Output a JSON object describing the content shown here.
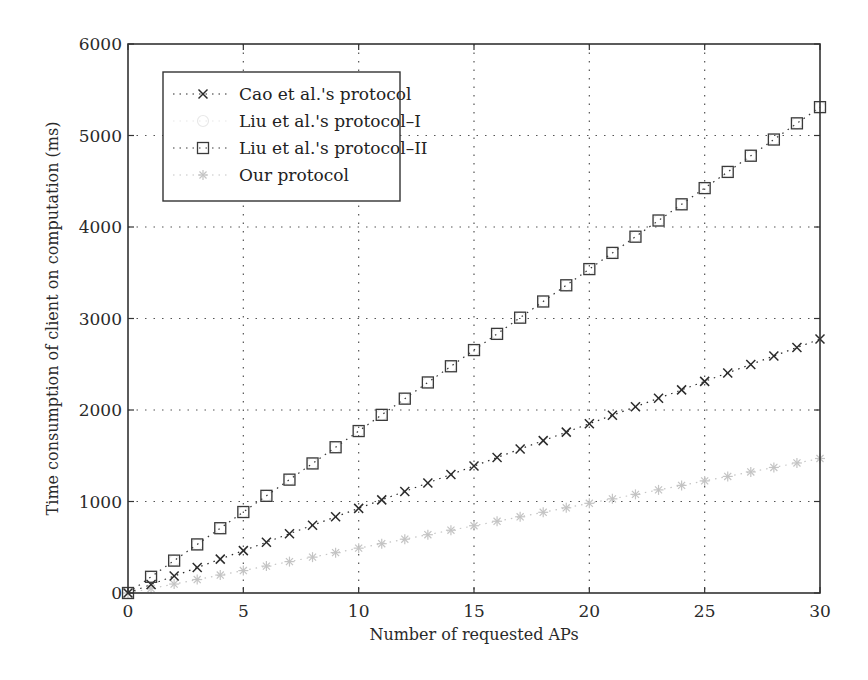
{
  "chart_data": {
    "type": "line",
    "title": "",
    "xlabel": "Number of requested APs",
    "ylabel": "Time consumption of client on computation (ms)",
    "xlim": [
      0,
      30
    ],
    "ylim": [
      0,
      6000
    ],
    "xticks": [
      0,
      5,
      10,
      15,
      20,
      25,
      30
    ],
    "yticks": [
      0,
      1000,
      2000,
      3000,
      4000,
      5000,
      6000
    ],
    "grid": true,
    "legend_position": "top-left",
    "x": [
      0,
      1,
      2,
      3,
      4,
      5,
      6,
      7,
      8,
      9,
      10,
      11,
      12,
      13,
      14,
      15,
      16,
      17,
      18,
      19,
      20,
      21,
      22,
      23,
      24,
      25,
      26,
      27,
      28,
      29,
      30
    ],
    "series": [
      {
        "name": "Cao et al.'s protocol",
        "marker": "x",
        "color": "#2b2b2b",
        "values": [
          0,
          93,
          185,
          278,
          370,
          463,
          555,
          648,
          740,
          833,
          925,
          1018,
          1110,
          1203,
          1295,
          1388,
          1480,
          1573,
          1665,
          1758,
          1850,
          1943,
          2035,
          2128,
          2220,
          2313,
          2405,
          2498,
          2590,
          2683,
          2775
        ]
      },
      {
        "name": "Liu et al.'s protocol–I",
        "marker": "o",
        "color": "#e8e8e8",
        "values": [
          0,
          177,
          354,
          531,
          708,
          885,
          1062,
          1239,
          1416,
          1593,
          1770,
          1947,
          2124,
          2301,
          2478,
          2655,
          2832,
          3009,
          3186,
          3363,
          3540,
          3717,
          3894,
          4071,
          4248,
          4425,
          4602,
          4779,
          4956,
          5133,
          5310
        ]
      },
      {
        "name": "Liu et al.'s protocol–II",
        "marker": "s",
        "color": "#3a3a3a",
        "values": [
          0,
          177,
          354,
          531,
          708,
          885,
          1062,
          1239,
          1416,
          1593,
          1770,
          1947,
          2124,
          2301,
          2478,
          2655,
          2832,
          3009,
          3186,
          3363,
          3540,
          3717,
          3894,
          4071,
          4248,
          4425,
          4602,
          4779,
          4956,
          5133,
          5310
        ]
      },
      {
        "name": "Our protocol",
        "marker": "*",
        "color": "#c4c4c4",
        "values": [
          0,
          49,
          98,
          147,
          196,
          245,
          294,
          343,
          392,
          441,
          490,
          539,
          588,
          637,
          686,
          735,
          784,
          833,
          882,
          931,
          980,
          1029,
          1078,
          1127,
          1176,
          1225,
          1274,
          1323,
          1372,
          1421,
          1470
        ]
      }
    ]
  }
}
